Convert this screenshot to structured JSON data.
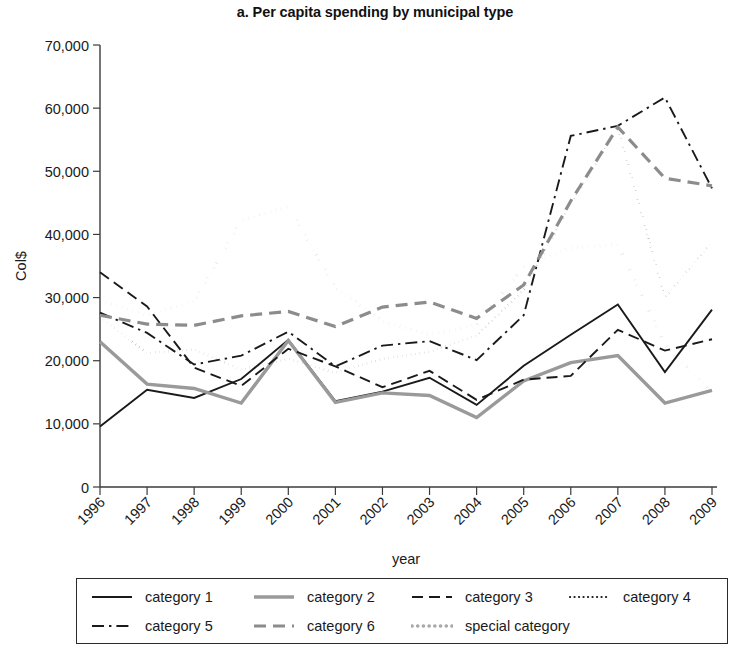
{
  "chart_data": {
    "type": "line",
    "title": "a. Per capita spending by municipal type",
    "xlabel": "year",
    "ylabel": "Col$",
    "grid": false,
    "legend_position": "bottom",
    "x": [
      1996,
      1997,
      1998,
      1999,
      2000,
      2001,
      2002,
      2003,
      2004,
      2005,
      2006,
      2007,
      2008,
      2009
    ],
    "xtick_labels": [
      "1996",
      "1997",
      "1998",
      "1999",
      "2000",
      "2001",
      "2002",
      "2003",
      "2004",
      "2005",
      "2006",
      "2007",
      "2008",
      "2009"
    ],
    "ytick_labels": [
      "0",
      "10,000",
      "20,000",
      "30,000",
      "40,000",
      "50,000",
      "60,000",
      "70,000"
    ],
    "yticks": [
      0,
      10000,
      20000,
      30000,
      40000,
      50000,
      60000,
      70000
    ],
    "ylim": [
      0,
      70000
    ],
    "xlim": [
      1996,
      2009
    ],
    "series": [
      {
        "name": "category 1",
        "color": "#1a1a1a",
        "dash": "none",
        "width": 1.9,
        "values": [
          9600,
          15400,
          14100,
          17100,
          23300,
          13600,
          15100,
          17300,
          13000,
          19200,
          24100,
          28900,
          18200,
          28100
        ]
      },
      {
        "name": "category 2",
        "color": "#9a9a9a",
        "dash": "none",
        "width": 3.4,
        "values": [
          23000,
          16300,
          15600,
          13300,
          23200,
          13400,
          14900,
          14500,
          11000,
          16800,
          19700,
          20800,
          13300,
          15300
        ]
      },
      {
        "name": "category 3",
        "color": "#1a1a1a",
        "dash": "dashed",
        "width": 1.9,
        "values": [
          34000,
          28600,
          18900,
          16000,
          21900,
          19100,
          15800,
          18400,
          13800,
          17000,
          17600,
          24900,
          21600,
          23400
        ]
      },
      {
        "name": "category 4",
        "color": "#1a1a1a",
        "dash": "dotted",
        "width": 2.2,
        "values": [
          26900,
          21200,
          21800,
          18600,
          20300,
          18100,
          20300,
          21400,
          24000,
          31200,
          44800,
          56900,
          30000,
          38800
        ]
      },
      {
        "name": "category 5",
        "color": "#1a1a1a",
        "dash": "dashdot",
        "width": 1.9,
        "values": [
          27600,
          24400,
          19400,
          20800,
          24600,
          19100,
          22400,
          23100,
          20100,
          27200,
          55600,
          57200,
          61700,
          47300
        ]
      },
      {
        "name": "category 6",
        "color": "#8c8c8c",
        "dash": "dashed",
        "width": 3.2,
        "values": [
          27200,
          25800,
          25600,
          27100,
          27800,
          25400,
          28500,
          29300,
          26700,
          32000,
          45300,
          57000,
          48900,
          47700
        ]
      },
      {
        "name": "special category",
        "color": "#a8a8a8",
        "dash": "dotted",
        "width": 3.6,
        "values": [
          29400,
          27200,
          29400,
          42200,
          44400,
          31600,
          26300,
          24100,
          25700,
          34900,
          37900,
          38400,
          22600,
          14900
        ]
      }
    ]
  },
  "legend": {
    "rows": [
      [
        {
          "label": "category 1",
          "swatch": "solid-black"
        },
        {
          "label": "category 2",
          "swatch": "solid-gray"
        },
        {
          "label": "category 3",
          "swatch": "dashed-black"
        },
        {
          "label": "category 4",
          "swatch": "dotted-black"
        }
      ],
      [
        {
          "label": "category 5",
          "swatch": "dashdot-black"
        },
        {
          "label": "category 6",
          "swatch": "dashed-gray"
        },
        {
          "label": "special category",
          "swatch": "dotted-gray"
        }
      ]
    ]
  }
}
